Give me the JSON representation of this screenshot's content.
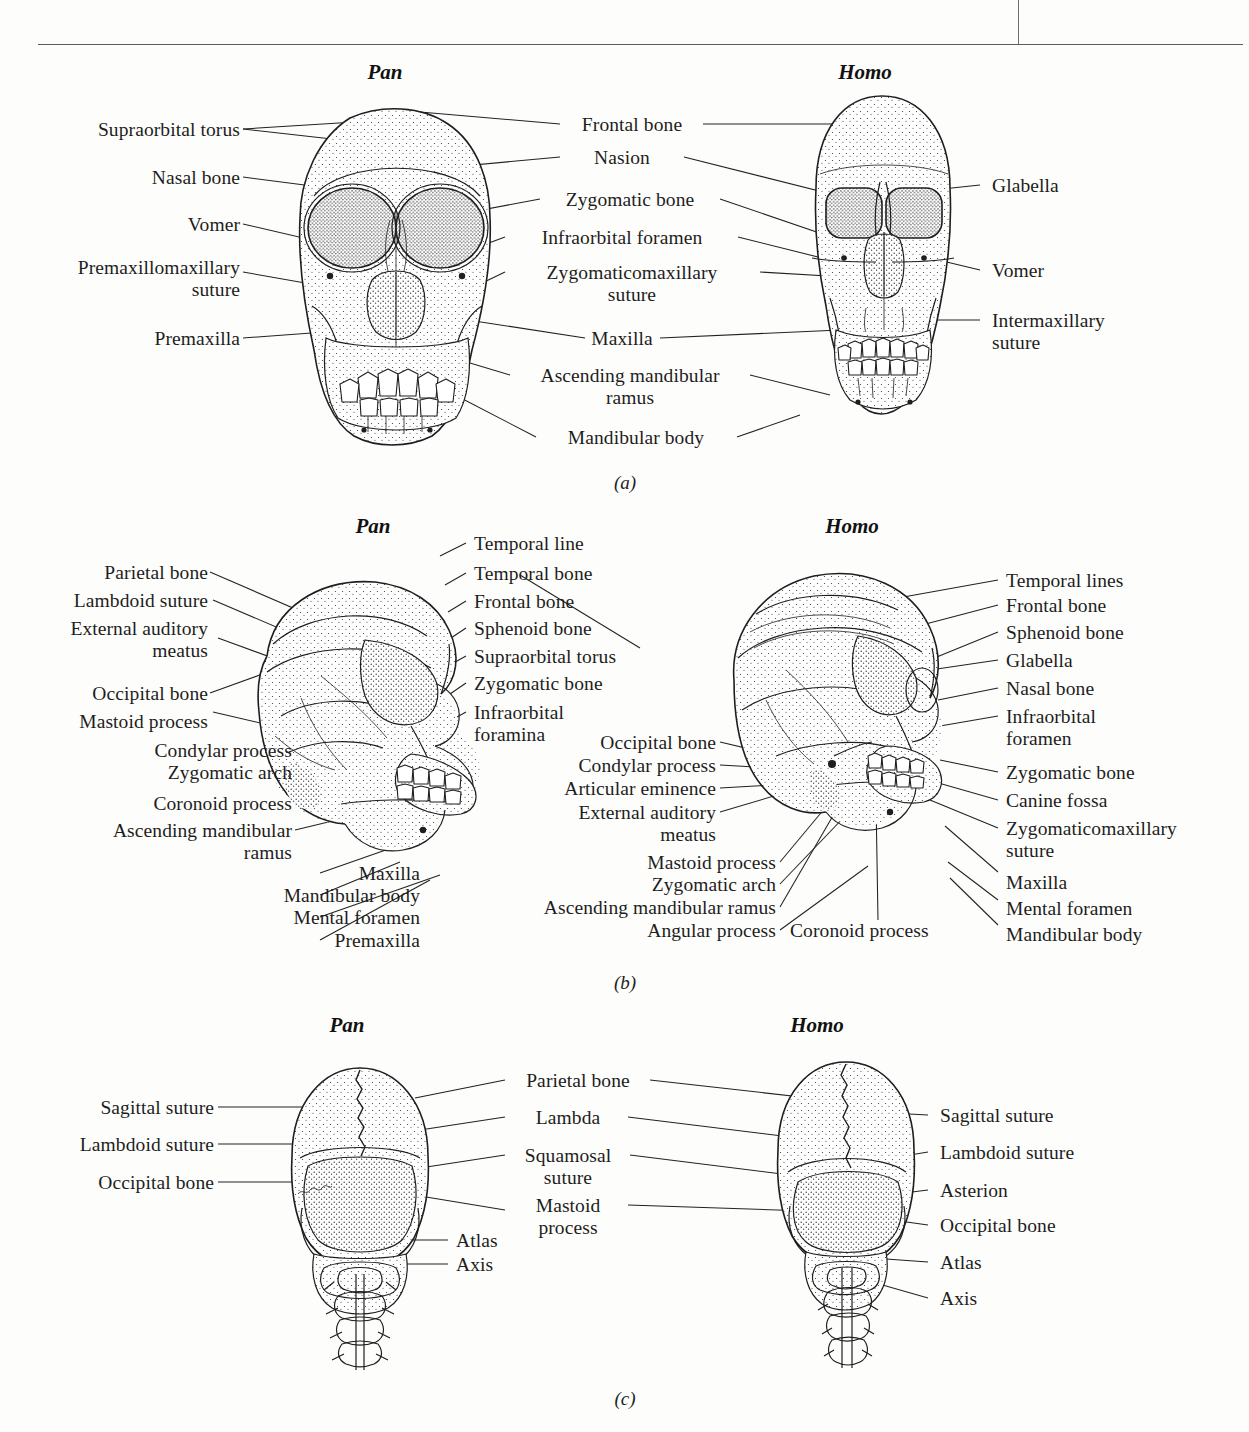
{
  "running_head": {
    "text": "",
    "visible_fragment": ""
  },
  "figure": {
    "panels": [
      {
        "id": "a",
        "caption": "(a)",
        "left_taxon": "Pan",
        "right_taxon": "Homo",
        "view": "frontal",
        "left_labels": [
          "Supraorbital torus",
          "Nasal bone",
          "Vomer",
          "Premaxillomaxillary\nsuture",
          "Premaxilla"
        ],
        "center_labels": [
          "Frontal bone",
          "Nasion",
          "Zygomatic bone",
          "Infraorbital foramen",
          "Zygomaticomaxillary\nsuture",
          "Maxilla",
          "Ascending mandibular\nramus",
          "Mandibular body"
        ],
        "right_labels": [
          "Glabella",
          "Vomer",
          "Intermaxillary\nsuture"
        ]
      },
      {
        "id": "b",
        "caption": "(b)",
        "left_taxon": "Pan",
        "right_taxon": "Homo",
        "view": "lateral",
        "left_labels": [
          "Parietal bone",
          "Lambdoid suture",
          "External auditory\nmeatus",
          "Occipital bone",
          "Mastoid process",
          "Condylar process",
          "Zygomatic arch",
          "Coronoid process",
          "Ascending mandibular\nramus",
          "Maxilla",
          "Mandibular body",
          "Mental foramen",
          "Premaxilla"
        ],
        "center_left_labels": [
          "Temporal line",
          "Temporal bone",
          "Frontal bone",
          "Sphenoid bone",
          "Supraorbital torus",
          "Zygomatic bone",
          "Infraorbital\nforamina"
        ],
        "center_right_labels": [
          "Occipital bone",
          "Condylar process",
          "Articular eminence",
          "External auditory\nmeatus",
          "Mastoid process",
          "Zygomatic arch",
          "Ascending mandibular ramus",
          "Angular process",
          "Coronoid process"
        ],
        "right_labels": [
          "Temporal lines",
          "Frontal bone",
          "Sphenoid bone",
          "Glabella",
          "Nasal bone",
          "Infraorbital\nforamen",
          "Zygomatic bone",
          "Canine fossa",
          "Zygomaticomaxillary\nsuture",
          "Maxilla",
          "Mental foramen",
          "Mandibular body"
        ]
      },
      {
        "id": "c",
        "caption": "(c)",
        "left_taxon": "Pan",
        "right_taxon": "Homo",
        "view": "posterior",
        "left_labels": [
          "Sagittal suture",
          "Lambdoid suture",
          "Occipital bone"
        ],
        "center_labels": [
          "Parietal bone",
          "Lambda",
          "Squamosal\nsuture",
          "Mastoid\nprocess",
          "Atlas",
          "Axis"
        ],
        "right_labels": [
          "Sagittal suture",
          "Lambdoid suture",
          "Asterion",
          "Occipital bone",
          "Atlas",
          "Axis"
        ]
      }
    ]
  },
  "colors": {
    "ink": "#1d1d1d",
    "paper": "#fdfdfc",
    "rule": "#5d5d5d"
  }
}
